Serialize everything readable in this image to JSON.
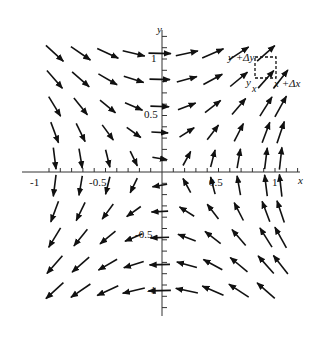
{
  "figure": {
    "type": "vector-field",
    "axes": {
      "x_label": "x",
      "y_label": "y",
      "x_ticks": [
        "-1",
        "-0.5",
        "0.5",
        "1"
      ],
      "y_ticks": [
        "1",
        "0.5",
        "-0.5",
        "-1"
      ],
      "range": [
        -1.1,
        1.1
      ]
    },
    "annotation": {
      "top_left": "y +Δy",
      "bottom_left_y": "y",
      "bottom_left_x": "x",
      "bottom_right": "x +Δx"
    },
    "color": "#111111"
  }
}
